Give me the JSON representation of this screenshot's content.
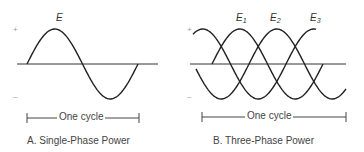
{
  "panel_a": {
    "wave_label": "E",
    "plus": "+",
    "minus": "–",
    "cycle_label": "One cycle",
    "caption": "A. Single-Phase Power"
  },
  "panel_b": {
    "wave_labels": [
      {
        "base": "E",
        "sub": "1"
      },
      {
        "base": "E",
        "sub": "2"
      },
      {
        "base": "E",
        "sub": "3"
      }
    ],
    "plus": "+",
    "minus": "–",
    "cycle_label": "One cycle",
    "caption": "B. Three-Phase Power"
  },
  "colors": {
    "line": "#2a2a2a",
    "text": "#444444"
  }
}
